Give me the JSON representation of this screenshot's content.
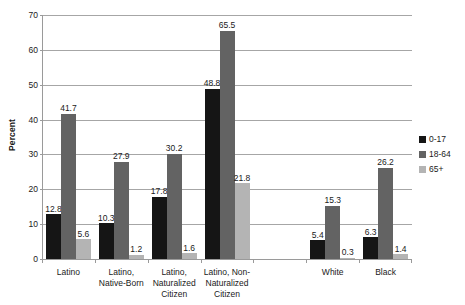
{
  "chart_data": {
    "type": "bar",
    "title": "",
    "xlabel": "",
    "ylabel": "Percent",
    "ylim": [
      0,
      70
    ],
    "yticks": [
      0,
      10,
      20,
      30,
      40,
      50,
      60,
      70
    ],
    "grid": true,
    "legend_position": "right",
    "categories": [
      "Latino",
      "Latino, Native-Born",
      "Latino, Naturalized Citizen",
      "Latino, Non-Naturalized Citizen",
      "",
      "White",
      "Black"
    ],
    "series": [
      {
        "name": "0-17",
        "color": "#151515",
        "values": [
          12.8,
          10.3,
          17.8,
          48.8,
          null,
          5.4,
          6.3
        ]
      },
      {
        "name": "18-64",
        "color": "#636363",
        "values": [
          41.7,
          27.9,
          30.2,
          65.5,
          null,
          15.3,
          26.2
        ]
      },
      {
        "name": "65+",
        "color": "#b4b4b4",
        "values": [
          5.6,
          1.2,
          1.6,
          21.8,
          null,
          0.3,
          1.4
        ]
      }
    ]
  },
  "axis": {
    "y_title": "Percent",
    "tick_labels": [
      "0",
      "10",
      "20",
      "30",
      "40",
      "50",
      "60",
      "70"
    ]
  },
  "legend": {
    "items": [
      {
        "label": "0-17",
        "color": "#151515"
      },
      {
        "label": "18-64",
        "color": "#636363"
      },
      {
        "label": "65+",
        "color": "#b4b4b4"
      }
    ]
  },
  "colors": {
    "axis": "#9a9a9a",
    "grid": "#a6a6a6",
    "text": "#1a1a1a",
    "background": "#ffffff"
  }
}
